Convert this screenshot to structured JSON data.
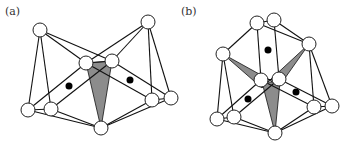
{
  "figure": {
    "panels": [
      {
        "label": "(a)",
        "label_pos": [
          5,
          15
        ],
        "node_radius": 7,
        "nodes": [
          {
            "id": "tl",
            "x": 40,
            "y": 30
          },
          {
            "id": "tr",
            "x": 148,
            "y": 22
          },
          {
            "id": "cl",
            "x": 86,
            "y": 63
          },
          {
            "id": "cr",
            "x": 112,
            "y": 61
          },
          {
            "id": "blf",
            "x": 28,
            "y": 110
          },
          {
            "id": "bln",
            "x": 51,
            "y": 109
          },
          {
            "id": "b",
            "x": 101,
            "y": 128
          },
          {
            "id": "rn",
            "x": 152,
            "y": 100
          },
          {
            "id": "rf",
            "x": 171,
            "y": 98
          }
        ],
        "edges": [
          [
            "tl",
            "blf"
          ],
          [
            "tl",
            "bln"
          ],
          [
            "tl",
            "cr"
          ],
          [
            "tl",
            "cl"
          ],
          [
            "tr",
            "cl"
          ],
          [
            "tr",
            "cr"
          ],
          [
            "tr",
            "rn"
          ],
          [
            "tr",
            "rf"
          ],
          [
            "cl",
            "cr"
          ],
          [
            "cl",
            "blf"
          ],
          [
            "cl",
            "rn"
          ],
          [
            "cr",
            "bln"
          ],
          [
            "cr",
            "rf"
          ],
          [
            "blf",
            "bln"
          ],
          [
            "blf",
            "b"
          ],
          [
            "bln",
            "b"
          ],
          [
            "rn",
            "rf"
          ],
          [
            "rn",
            "b"
          ],
          [
            "rf",
            "b"
          ]
        ],
        "shaded_polygons": [
          [
            [
              86,
              63
            ],
            [
              112,
              61
            ],
            [
              101,
              128
            ]
          ]
        ],
        "dots": [
          {
            "x": 69,
            "y": 86
          },
          {
            "x": 130,
            "y": 80
          }
        ]
      },
      {
        "label": "(b)",
        "label_pos": [
          181,
          15
        ],
        "node_radius": 7,
        "nodes": [
          {
            "id": "tl",
            "x": 257,
            "y": 23
          },
          {
            "id": "tr",
            "x": 274,
            "y": 20
          },
          {
            "id": "ru",
            "x": 309,
            "y": 44
          },
          {
            "id": "lu",
            "x": 223,
            "y": 54
          },
          {
            "id": "cl",
            "x": 261,
            "y": 80
          },
          {
            "id": "cr",
            "x": 279,
            "y": 79
          },
          {
            "id": "blf",
            "x": 217,
            "y": 119
          },
          {
            "id": "bln",
            "x": 234,
            "y": 117
          },
          {
            "id": "b",
            "x": 275,
            "y": 133
          },
          {
            "id": "rln",
            "x": 314,
            "y": 107
          },
          {
            "id": "rlf",
            "x": 332,
            "y": 106
          }
        ],
        "edges": [
          [
            "tl",
            "tr"
          ],
          [
            "tl",
            "lu"
          ],
          [
            "tl",
            "ru"
          ],
          [
            "tl",
            "cl"
          ],
          [
            "tr",
            "ru"
          ],
          [
            "tr",
            "cr"
          ],
          [
            "lu",
            "blf"
          ],
          [
            "lu",
            "bln"
          ],
          [
            "ru",
            "rln"
          ],
          [
            "ru",
            "rlf"
          ],
          [
            "cl",
            "cr"
          ],
          [
            "cl",
            "blf"
          ],
          [
            "cl",
            "rln"
          ],
          [
            "cr",
            "bln"
          ],
          [
            "cr",
            "rlf"
          ],
          [
            "blf",
            "bln"
          ],
          [
            "blf",
            "b"
          ],
          [
            "bln",
            "b"
          ],
          [
            "rln",
            "rlf"
          ],
          [
            "rln",
            "b"
          ],
          [
            "rlf",
            "b"
          ]
        ],
        "shaded_polygons": [
          [
            [
              223,
              54
            ],
            [
              270,
              80
            ],
            [
              262,
              88
            ]
          ],
          [
            [
              309,
              44
            ],
            [
              270,
              80
            ],
            [
              278,
              88
            ]
          ],
          [
            [
              262,
              82
            ],
            [
              280,
              82
            ],
            [
              275,
              133
            ]
          ]
        ],
        "dots": [
          {
            "x": 268,
            "y": 50
          },
          {
            "x": 248,
            "y": 99
          },
          {
            "x": 296,
            "y": 92
          }
        ]
      }
    ]
  }
}
